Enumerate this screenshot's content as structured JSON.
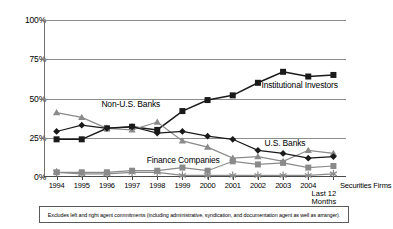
{
  "chart_data": {
    "type": "line",
    "title": "",
    "xlabel": "",
    "ylabel": "",
    "ylim": [
      0,
      100
    ],
    "yticks": [
      "0%",
      "25%",
      "50%",
      "75%",
      "100%"
    ],
    "ytick_values": [
      0,
      25,
      50,
      75,
      100
    ],
    "grid": true,
    "legend_position": "inline-annotations",
    "categories": [
      "1994",
      "1995",
      "1996",
      "1997",
      "1998",
      "1999",
      "2000",
      "2001",
      "2002",
      "2003",
      "2004",
      "Last 12 Months 9/30/05"
    ],
    "x_tick_labels": [
      "1994",
      "1995",
      "1996",
      "1997",
      "1998",
      "1999",
      "2000",
      "2001",
      "2002",
      "2003",
      "2004"
    ],
    "end_tick_label": "Last 12\nMonths\n9/30/05",
    "series": [
      {
        "name": "Institutional Investors",
        "marker": "filled-square",
        "color": "#1a1a1a",
        "values": [
          24,
          24,
          31,
          32,
          30,
          42,
          49,
          52,
          60,
          67,
          64,
          65
        ]
      },
      {
        "name": "Non-U.S. Banks",
        "marker": "triangle",
        "color": "#8a8a8a",
        "values": [
          41,
          38,
          31,
          30,
          35,
          23,
          19,
          12,
          13,
          10,
          17,
          15
        ]
      },
      {
        "name": "U.S. Banks",
        "marker": "diamond",
        "color": "#1a1a1a",
        "values": [
          29,
          33,
          31,
          32,
          28,
          29,
          26,
          24,
          17,
          15,
          12,
          13
        ]
      },
      {
        "name": "Finance Companies",
        "marker": "square",
        "color": "#8a8a8a",
        "values": [
          3,
          3,
          3,
          4,
          4,
          6,
          4,
          10,
          8,
          9,
          6,
          7
        ]
      },
      {
        "name": "Securities Firms",
        "marker": "asterisk",
        "color": "#8a8a8a",
        "values": [
          3,
          2,
          2,
          3,
          3,
          1,
          1,
          1,
          1,
          1,
          1,
          2
        ]
      }
    ],
    "annotations": [
      {
        "text": "Non-U.S. Banks",
        "x_pct": 19,
        "y_pct": 54
      },
      {
        "text": "Institutional Investors",
        "x_pct": 72,
        "y_pct": 42
      },
      {
        "text": "U.S. Banks",
        "x_pct": 73,
        "y_pct": 79
      },
      {
        "text": "Finance Companies",
        "x_pct": 34,
        "y_pct": 90
      },
      {
        "text": "Securities Firms",
        "x_pct": 100,
        "y_pct": 100
      }
    ]
  },
  "footnote": {
    "text": "Excludes left and right agent commitments (including administrative, syndication, and documentation agent as well as arranger)."
  }
}
